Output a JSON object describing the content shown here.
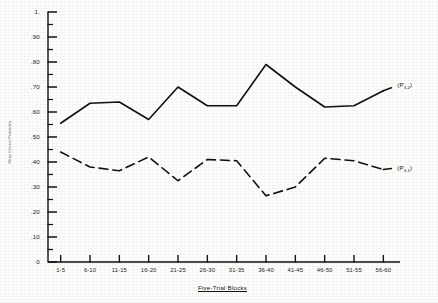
{
  "chart_data": {
    "type": "line",
    "title": "",
    "xlabel": "Five-Trial Blocks",
    "ylabel": "Mean Correct Probability",
    "categories": [
      "1-5",
      "6-10",
      "11-15",
      "16-20",
      "21-25",
      "26-30",
      "31-35",
      "36-40",
      "41-45",
      "46-50",
      "51-55",
      "56-60"
    ],
    "ylim": [
      0,
      1.0
    ],
    "ytick_labels": [
      "1.",
      ".90",
      ".80",
      ".70",
      ".60",
      ".50",
      ".40",
      ".30",
      ".20",
      ".10",
      "0"
    ],
    "ytick_values": [
      1.0,
      0.9,
      0.8,
      0.7,
      0.6,
      0.5,
      0.4,
      0.3,
      0.2,
      0.1,
      0.0
    ],
    "grid": false,
    "legend_position": "right-inline",
    "series": [
      {
        "name": "(P3,2)",
        "label_main": "(P",
        "label_sub1": "3,2",
        "label_close": ")",
        "style": "solid",
        "color": "#111111",
        "values": [
          0.555,
          0.635,
          0.64,
          0.57,
          0.7,
          0.625,
          0.625,
          0.79,
          0.7,
          0.62,
          0.625,
          0.685
        ]
      },
      {
        "name": "(P3,1)",
        "label_main": "(P",
        "label_sub1": "3,1",
        "label_close": ")",
        "style": "dashed",
        "color": "#111111",
        "values": [
          0.44,
          0.38,
          0.365,
          0.42,
          0.325,
          0.41,
          0.405,
          0.265,
          0.3,
          0.415,
          0.405,
          0.37
        ]
      }
    ]
  }
}
